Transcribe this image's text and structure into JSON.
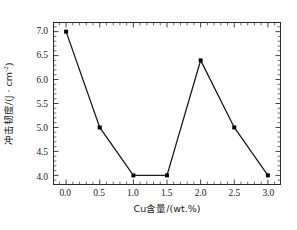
{
  "chart_data": {
    "type": "line",
    "title": "",
    "subtitle": "",
    "xlabel_text": "Cu含量/(wt.%)",
    "ylabel_prefix": "冲击韧度/(J · cm",
    "ylabel_exponent": "-2",
    "ylabel_suffix": ")",
    "ylabel_plain": "冲击韧度/(J · cm⁻²)",
    "x": [
      0.0,
      0.5,
      1.0,
      1.5,
      2.0,
      2.5,
      3.0
    ],
    "values": [
      7.0,
      5.0,
      4.0,
      4.0,
      6.4,
      5.0,
      4.0
    ],
    "series": [
      {
        "name": "冲击韧度",
        "values": [
          7.0,
          5.0,
          4.0,
          4.0,
          6.4,
          5.0,
          4.0
        ]
      }
    ],
    "points": [
      {
        "x": 0.0,
        "y": 7.0
      },
      {
        "x": 0.5,
        "y": 5.0
      },
      {
        "x": 1.0,
        "y": 4.0
      },
      {
        "x": 1.5,
        "y": 4.0
      },
      {
        "x": 2.0,
        "y": 6.4
      },
      {
        "x": 2.5,
        "y": 5.0
      },
      {
        "x": 3.0,
        "y": 4.0
      }
    ],
    "xlim": [
      -0.18,
      3.18
    ],
    "ylim": [
      3.82,
      7.18
    ],
    "xticks": [
      0.0,
      0.5,
      1.0,
      1.5,
      2.0,
      2.5,
      3.0
    ],
    "xtick_labels": [
      "0.0",
      "0.5",
      "1.0",
      "1.5",
      "2.0",
      "2.5",
      "3.0"
    ],
    "yticks": [
      4.0,
      4.5,
      5.0,
      5.5,
      6.0,
      6.5,
      7.0
    ],
    "ytick_labels": [
      "4.0",
      "4.5",
      "5.0",
      "5.5",
      "6.0",
      "6.5",
      "7.0"
    ],
    "x_minor_step": 0.1,
    "y_minor_step": 0.1,
    "grid": false,
    "legend": false,
    "legend_position": "none",
    "marker": "filled-square",
    "marker_size_px": 4,
    "line_width_px": 1.3,
    "line_color": "#1a1a1a",
    "marker_color": "#000000",
    "frame_color": "#2b2b2b",
    "background_color": "#ffffff",
    "tick_direction": "in"
  }
}
